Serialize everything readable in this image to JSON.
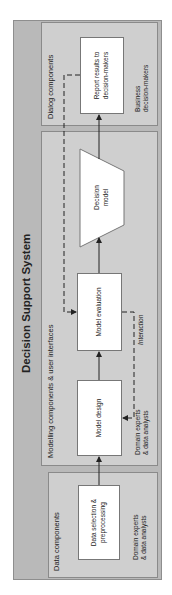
{
  "diagram": {
    "title": "Decision Support System",
    "groups": [
      {
        "id": "data",
        "label": "Data components",
        "actor": "Domain experts\n& data analysts"
      },
      {
        "id": "modelling",
        "label": "Modelling components & user interfaces",
        "actor": "Domain experts\n& data analysts"
      },
      {
        "id": "dialog",
        "label": "Dialog components",
        "actor": "Business\ndecision-makers"
      }
    ],
    "nodes": [
      {
        "id": "data_selection",
        "label": "Data selection &\npreprocessing",
        "shape": "rectangle"
      },
      {
        "id": "model_design",
        "label": "Model design",
        "shape": "rectangle"
      },
      {
        "id": "model_evaluation",
        "label": "Model evaluation",
        "shape": "rectangle"
      },
      {
        "id": "decision_model",
        "label": "Decision\nmodel",
        "shape": "parallelogram"
      },
      {
        "id": "report",
        "label": "Report results to\ndecision-makers",
        "shape": "rectangle"
      }
    ],
    "edges": [
      {
        "from": "data_selection",
        "to": "model_design",
        "style": "solid"
      },
      {
        "from": "model_design",
        "to": "model_evaluation",
        "style": "solid"
      },
      {
        "from": "model_evaluation",
        "to": "decision_model",
        "style": "solid"
      },
      {
        "from": "decision_model",
        "to": "report",
        "style": "solid"
      },
      {
        "from": "report",
        "to": "model_evaluation",
        "style": "dashed"
      },
      {
        "from": "model_evaluation",
        "to": "model_design",
        "style": "dashed",
        "label": "Interaction"
      }
    ],
    "interaction_label": "Interaction",
    "orientation": "rotated 90° counter-clockwise",
    "colors": {
      "outer": "#b9b9b9",
      "group": "#cfcfcf",
      "node": "#ffffff",
      "line": "#222222"
    }
  }
}
